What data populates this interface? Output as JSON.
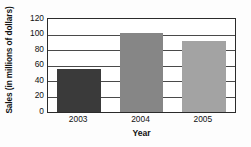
{
  "chart_data": {
    "type": "bar",
    "title": "",
    "categories": [
      "2003",
      "2004",
      "2005"
    ],
    "values": [
      56,
      102,
      91
    ],
    "series": [
      {
        "name": "Sales",
        "values": [
          56,
          102,
          91
        ]
      }
    ],
    "xlabel": "Year",
    "ylabel": "Sales (in millions of dollars)",
    "ylim": [
      0,
      120
    ],
    "yticks": [
      0,
      20,
      40,
      60,
      80,
      100,
      120
    ],
    "ytick_labels": [
      "0",
      "20",
      "40",
      "60",
      "80",
      "100",
      "120"
    ],
    "grid": true,
    "grid_axis": "y",
    "legend": false,
    "bar_colors": [
      "#3a3a3a",
      "#868686",
      "#a3a3a3"
    ],
    "frame_color": "#2b2b2b",
    "background": "#ffffff"
  }
}
